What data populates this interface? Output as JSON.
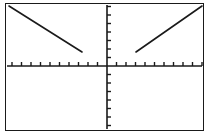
{
  "screen": {
    "name": "graphing-calculator-screen",
    "width": 210,
    "height": 137,
    "background_color": "#ffffff",
    "border_color": "#1a1a1a"
  },
  "frame": {
    "label": "graph viewport",
    "x": 5,
    "y": 3,
    "width": 199,
    "height": 128,
    "border_width": 1
  },
  "chart_data": {
    "type": "line",
    "title": "",
    "subtitle": "",
    "xlabel": "",
    "ylabel": "",
    "grid": false,
    "legend_position": "none",
    "axis_color": "#1a1a1a",
    "series_color": "#1a1a1a",
    "series_width": 1.6,
    "origin_px": {
      "x": 107,
      "y": 66
    },
    "tick_spacing_px": {
      "x": 9.5,
      "y": 8.5
    },
    "tick_length_px": {
      "x": 4,
      "y": 4
    },
    "tick_counts": {
      "x_left": 10,
      "x_right": 10,
      "y_above": 7,
      "y_below": 7
    },
    "xlim": [
      -10.5,
      10.5
    ],
    "ylim": [
      -7.5,
      7.5
    ],
    "axes": {
      "x_axis": {
        "y_px": 66,
        "x_start_px": 7,
        "x_end_px": 202
      },
      "y_axis": {
        "x_px": 107,
        "y_start_px": 5,
        "y_end_px": 129
      }
    },
    "series": [
      {
        "name": "left-branch",
        "description": "descending line segment in second quadrant",
        "points_px": [
          {
            "x": 9,
            "y": 6
          },
          {
            "x": 82,
            "y": 52
          }
        ],
        "x": [
          -10.3,
          -2.6
        ],
        "y": [
          7.1,
          1.6
        ]
      },
      {
        "name": "right-branch",
        "description": "ascending line segment in first quadrant",
        "points_px": [
          {
            "x": 136,
            "y": 52
          },
          {
            "x": 202,
            "y": 6
          }
        ],
        "x": [
          3.1,
          10.0
        ],
        "y": [
          1.6,
          7.1
        ]
      }
    ]
  }
}
